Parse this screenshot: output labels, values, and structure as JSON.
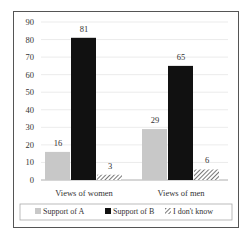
{
  "chart_data": {
    "type": "bar",
    "title": "",
    "xlabel": "",
    "ylabel": "",
    "categories": [
      "Views of women",
      "Views of men"
    ],
    "series": [
      {
        "name": "Support of A",
        "values": [
          16,
          29
        ],
        "color": "#c8c8c8"
      },
      {
        "name": "Support of B",
        "values": [
          81,
          65
        ],
        "color": "#111111"
      },
      {
        "name": "I don't know",
        "values": [
          3,
          6
        ],
        "color": "hatched"
      }
    ],
    "ylim": [
      0,
      90
    ],
    "yticks": [
      "0",
      "10",
      "20",
      "30",
      "40",
      "50",
      "60",
      "70",
      "80",
      "90"
    ],
    "grid": true,
    "legend_position": "bottom"
  }
}
